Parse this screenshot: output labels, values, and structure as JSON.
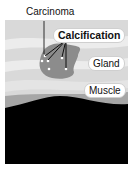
{
  "diagram": {
    "labels": {
      "carcinoma": "Carcinoma",
      "calcification": "Calcification",
      "gland": "Gland",
      "muscle": "Muscle"
    },
    "colors": {
      "background": "#ffffff",
      "tissue": "#d9d9d9",
      "gland_band": "#ececec",
      "carcinoma": "#8c8c8c",
      "muscle_band": "#a6a6a6",
      "dark_base": "#000000",
      "calcification_dots": "#ffffff"
    }
  }
}
